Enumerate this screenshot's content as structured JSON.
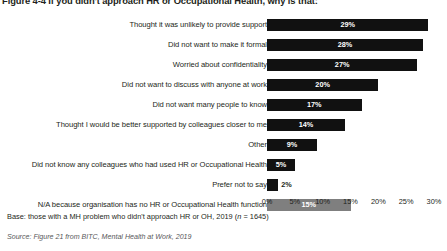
{
  "figure": {
    "title": "Figure 4-4 If you didn't approach HR or Occupational Health, why is that:",
    "base_note": "Base: those with a MH problem who didn't approach HR or OH, 2019 (n = 1645)",
    "source_note": "Source: Figure 21 from BITC, Mental Health at Work, 2019"
  },
  "colors": {
    "bar": "#111111",
    "bar_alt": "#7f7f7f",
    "value_label_inside": "#ffffff",
    "value_label_outside": "#231f20",
    "text": "#231f20",
    "source_text": "#58585a",
    "background": "#ffffff"
  },
  "chart_data": {
    "type": "bar",
    "orientation": "horizontal",
    "title": "Figure 4-4 If you didn't approach HR or Occupational Health, why is that:",
    "xlabel": "",
    "ylabel": "",
    "xlim": [
      0,
      30
    ],
    "grid": false,
    "legend": "none",
    "tick_labels": [
      "0%",
      "5%",
      "10%",
      "15%",
      "20%",
      "25%",
      "30%"
    ],
    "tick_values": [
      0,
      5,
      10,
      15,
      20,
      25,
      30
    ],
    "categories": [
      "Thought it was unlikely to provide support",
      "Did not want to make it formal",
      "Worried about confidentiality",
      "Did not want to discuss with anyone at work",
      "Did not want many people to know",
      "Thought I would be better supported by colleagues closer to me",
      "Other",
      "Did not know any colleagues who had used HR or Occupational Health",
      "Prefer not to say",
      "N/A because organisation has no HR or Occupational Health function"
    ],
    "values": [
      29,
      28,
      27,
      20,
      17,
      14,
      9,
      5,
      2,
      15
    ],
    "value_labels": [
      "29%",
      "28%",
      "27%",
      "20%",
      "17%",
      "14%",
      "9%",
      "5%",
      "2%",
      "15%"
    ],
    "bar_colors": [
      "#111111",
      "#111111",
      "#111111",
      "#111111",
      "#111111",
      "#111111",
      "#111111",
      "#111111",
      "#111111",
      "#7f7f7f"
    ],
    "label_placement": [
      "inside",
      "inside",
      "inside",
      "inside",
      "inside",
      "inside",
      "inside",
      "inside",
      "outside",
      "inside"
    ]
  }
}
